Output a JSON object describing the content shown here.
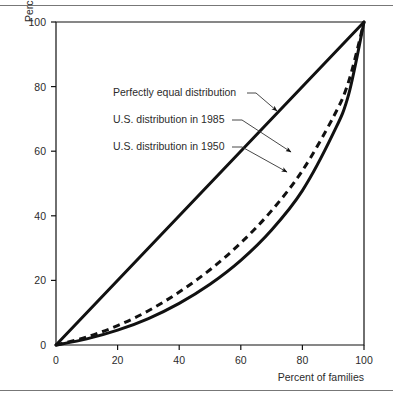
{
  "figure": {
    "background": "#ffffff",
    "rule_color": "#777777",
    "ink_color": "#111111"
  },
  "chart_data": {
    "type": "line",
    "title": "",
    "xlabel": "Percent of families",
    "ylabel": "Percent of income",
    "xlim": [
      0,
      100
    ],
    "ylim": [
      0,
      100
    ],
    "xticks": [
      "0",
      "20",
      "40",
      "60",
      "80",
      "100"
    ],
    "xtick_values": [
      0,
      20,
      40,
      60,
      80,
      100
    ],
    "yticks": [
      "0",
      "20",
      "40",
      "60",
      "80",
      "100"
    ],
    "ytick_values": [
      0,
      20,
      40,
      60,
      80,
      100
    ],
    "grid": false,
    "legend_position": "inline-annotations",
    "x": [
      0,
      10,
      20,
      30,
      40,
      50,
      60,
      70,
      80,
      90,
      95,
      100
    ],
    "series": [
      {
        "name": "Perfectly equal distribution",
        "style": "solid",
        "color": "#111111",
        "width": 3,
        "values": [
          0,
          10,
          20,
          30,
          40,
          50,
          60,
          70,
          80,
          90,
          95,
          100
        ]
      },
      {
        "name": "U.S. distribution in 1985",
        "style": "dashed",
        "color": "#111111",
        "width": 3,
        "values": [
          0,
          2.5,
          6.0,
          10.6,
          16.4,
          23.3,
          31.6,
          41.6,
          54.0,
          70.5,
          81.5,
          100
        ]
      },
      {
        "name": "U.S. distribution in 1950",
        "style": "solid",
        "color": "#111111",
        "width": 3,
        "values": [
          0,
          1.9,
          4.6,
          8.2,
          12.9,
          18.8,
          26.2,
          35.6,
          47.8,
          65.5,
          77.5,
          100
        ]
      }
    ],
    "annotations": [
      {
        "label": "Perfectly equal distribution",
        "text_x": 113,
        "text_y": 96,
        "leader": "M 247,93 L 256,93 L 277,111",
        "arrow_at": [
          277,
          111
        ]
      },
      {
        "label": "U.S. distribution in 1985",
        "text_x": 113,
        "text_y": 123,
        "leader": "M 232,120 L 242,120 L 291,152",
        "arrow_at": [
          291,
          152
        ]
      },
      {
        "label": "U.S. distribution in 1950",
        "text_x": 113,
        "text_y": 150,
        "leader": "M 232,147 L 242,147 L 287,172",
        "arrow_at": [
          287,
          172
        ]
      }
    ]
  }
}
